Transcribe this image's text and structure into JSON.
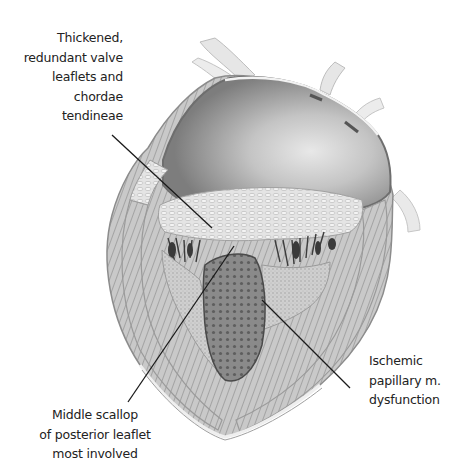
{
  "figure": {
    "style": "grayscale anatomical pencil illustration",
    "colors": {
      "background": "#ffffff",
      "label_text": "#222222",
      "leader_line": "#1a1a1a",
      "tissue_light": "#d9d9d9",
      "tissue_mid": "#a8a8a8",
      "tissue_dark": "#4a4a4a"
    }
  },
  "labels": {
    "thickened": {
      "lines": [
        "Thickened,",
        "redundant valve",
        "leaflets and",
        "chordae",
        "tendineae"
      ]
    },
    "ischemic": {
      "lines": [
        "Ischemic",
        "papillary m.",
        "dysfunction"
      ]
    },
    "middle_scallop": {
      "lines": [
        "Middle scallop",
        "of posterior leaflet",
        "most involved"
      ]
    }
  },
  "leader_lines": [
    {
      "name": "thickened-leader",
      "x1": 112,
      "y1": 135,
      "x2": 212,
      "y2": 228
    },
    {
      "name": "middle-scallop-leader",
      "x1": 128,
      "y1": 402,
      "x2": 234,
      "y2": 246
    },
    {
      "name": "ischemic-leader",
      "x1": 262,
      "y1": 300,
      "x2": 350,
      "y2": 388
    }
  ]
}
